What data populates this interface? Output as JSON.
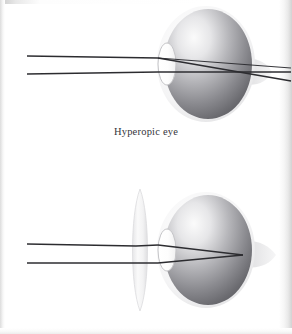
{
  "figure": {
    "background_color": "#ffffff",
    "width": 292,
    "height": 334
  },
  "panels": [
    {
      "id": "hyperopic-uncorrected",
      "caption": "Hyperopic eye",
      "description": "Parallel light rays focus behind the retina",
      "has_corrective_lens": false,
      "focal_point_x": 270,
      "focal_point_y": 65,
      "focus_location": "behind retina"
    },
    {
      "id": "hyperopic-corrected",
      "caption": "Hyperopic eye, corrected",
      "description": "A convex corrective lens brings the focal point onto the retina",
      "has_corrective_lens": true,
      "focal_point_x": 243,
      "focal_point_y": 255,
      "focus_location": "on retina"
    }
  ],
  "colors": {
    "eyeball_light": "#f2f2f2",
    "eyeball_mid": "#9a9a9e",
    "eyeball_dark": "#5d5d62",
    "sclera_halo": "#e4e4e6",
    "lens_fill": "#fcfcfc",
    "lens_stroke": "#c5c5c8",
    "ray_color": "#2c2c30",
    "caption_color": "#35343a",
    "optic_nerve": "#e0e0e2",
    "corrective_lens": "#efefef"
  },
  "labels": {
    "light_ray_upper": "upper light ray",
    "light_ray_lower": "lower light ray",
    "eyeball": "eyeball",
    "crystalline_lens": "crystalline lens",
    "cornea": "cornea",
    "retina": "retina",
    "optic_nerve": "optic nerve",
    "corrective_lens": "convex corrective lens"
  }
}
